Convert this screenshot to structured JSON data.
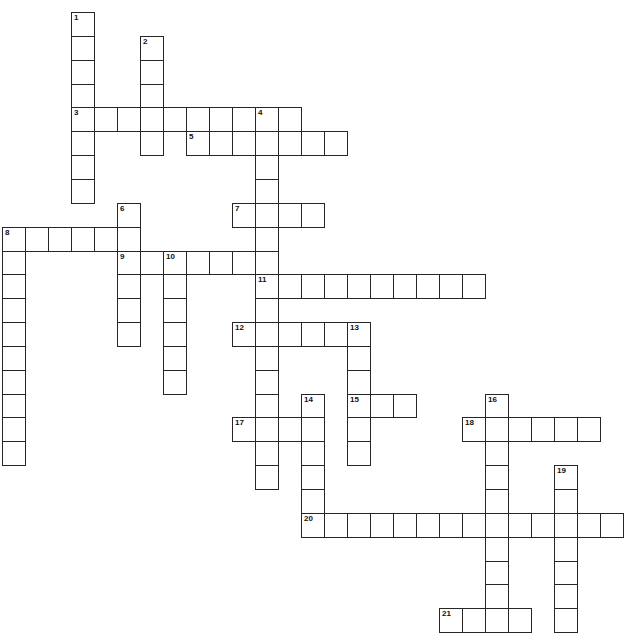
{
  "puzzle": {
    "type": "crossword",
    "grid": {
      "origin_x": 2,
      "origin_y": 12,
      "cell_w": 23,
      "cell_h": 23.85,
      "cols": 27,
      "rows": 26
    },
    "colors": {
      "border": "#262626",
      "cell_bg": "#ffffff",
      "number": "#111111"
    },
    "entries": [
      {
        "number": 1,
        "direction": "down",
        "row": 0,
        "col": 3,
        "length": 8
      },
      {
        "number": 2,
        "direction": "down",
        "row": 1,
        "col": 6,
        "length": 5
      },
      {
        "number": 3,
        "direction": "across",
        "row": 4,
        "col": 3,
        "length": 10
      },
      {
        "number": 4,
        "direction": "down",
        "row": 4,
        "col": 11,
        "length": 16
      },
      {
        "number": 5,
        "direction": "across",
        "row": 5,
        "col": 8,
        "length": 7
      },
      {
        "number": 6,
        "direction": "down",
        "row": 8,
        "col": 5,
        "length": 6
      },
      {
        "number": 7,
        "direction": "across",
        "row": 8,
        "col": 10,
        "length": 4
      },
      {
        "number": 8,
        "direction": "across",
        "row": 9,
        "col": 0,
        "length": 6
      },
      {
        "number": 8,
        "direction": "down",
        "row": 9,
        "col": 0,
        "length": 10
      },
      {
        "number": 9,
        "direction": "across",
        "row": 10,
        "col": 5,
        "length": 7
      },
      {
        "number": 10,
        "direction": "down",
        "row": 10,
        "col": 7,
        "length": 6
      },
      {
        "number": 11,
        "direction": "across",
        "row": 11,
        "col": 11,
        "length": 10
      },
      {
        "number": 12,
        "direction": "across",
        "row": 13,
        "col": 10,
        "length": 6
      },
      {
        "number": 13,
        "direction": "down",
        "row": 13,
        "col": 15,
        "length": 6
      },
      {
        "number": 14,
        "direction": "down",
        "row": 16,
        "col": 13,
        "length": 6
      },
      {
        "number": 15,
        "direction": "across",
        "row": 16,
        "col": 15,
        "length": 3
      },
      {
        "number": 16,
        "direction": "down",
        "row": 16,
        "col": 21,
        "length": 10
      },
      {
        "number": 17,
        "direction": "across",
        "row": 17,
        "col": 10,
        "length": 4
      },
      {
        "number": 18,
        "direction": "across",
        "row": 17,
        "col": 20,
        "length": 6
      },
      {
        "number": 19,
        "direction": "down",
        "row": 19,
        "col": 24,
        "length": 7
      },
      {
        "number": 20,
        "direction": "across",
        "row": 21,
        "col": 13,
        "length": 14
      },
      {
        "number": 21,
        "direction": "across",
        "row": 25,
        "col": 19,
        "length": 4
      }
    ]
  }
}
